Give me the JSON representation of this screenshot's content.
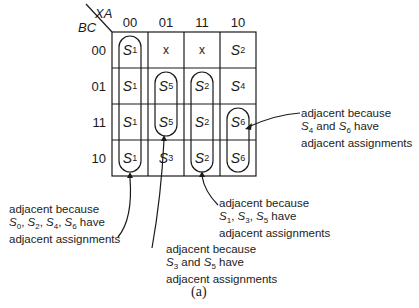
{
  "kmap": {
    "corner_col_var": "XA",
    "corner_row_var": "BC",
    "col_headers": [
      "00",
      "01",
      "11",
      "10"
    ],
    "row_headers": [
      "00",
      "01",
      "11",
      "10"
    ],
    "cells": [
      [
        {
          "s": "S",
          "n": "1"
        },
        {
          "t": "x"
        },
        {
          "t": "x"
        },
        {
          "s": "S",
          "n": "2"
        }
      ],
      [
        {
          "s": "S",
          "n": "1"
        },
        {
          "s": "S",
          "n": "5"
        },
        {
          "s": "S",
          "n": "2"
        },
        {
          "s": "S",
          "n": "4"
        }
      ],
      [
        {
          "s": "S",
          "n": "1"
        },
        {
          "s": "S",
          "n": "5"
        },
        {
          "s": "S",
          "n": "2"
        },
        {
          "s": "S",
          "n": "6"
        }
      ],
      [
        {
          "s": "S",
          "n": "1"
        },
        {
          "s": "S",
          "n": "3"
        },
        {
          "s": "S",
          "n": "2"
        },
        {
          "s": "S",
          "n": "6"
        }
      ]
    ],
    "groups": [
      {
        "name": "S1-column",
        "col": 0,
        "rows": [
          0,
          3
        ]
      },
      {
        "name": "S5-pair",
        "col": 1,
        "rows": [
          1,
          2
        ]
      },
      {
        "name": "S2-column",
        "col": 2,
        "rows": [
          1,
          3
        ]
      },
      {
        "name": "S6-pair",
        "col": 3,
        "rows": [
          2,
          3
        ]
      }
    ]
  },
  "annotations": {
    "s4_s6": {
      "line1": "adjacent because",
      "s_a": "S",
      "n_a": "4",
      "mid": " and ",
      "s_b": "S",
      "n_b": "6",
      "tail": " have",
      "line3": "adjacent assignments"
    },
    "s0246": {
      "line1": "adjacent because",
      "parts": [
        "S",
        "0",
        ", ",
        "S",
        "2",
        ", ",
        "S",
        "4",
        ", ",
        "S",
        "6"
      ],
      "tail": " have",
      "line3": "adjacent assignments"
    },
    "s135": {
      "line1": "adjacent because",
      "parts": [
        "S",
        "1",
        ", ",
        "S",
        "3",
        ", ",
        "S",
        "5"
      ],
      "tail": " have",
      "line3": "adjacent assignments"
    },
    "s35": {
      "line1": "adjacent because",
      "s_a": "S",
      "n_a": "3",
      "mid": " and ",
      "s_b": "S",
      "n_b": "5",
      "tail": " have",
      "line3": "adjacent assignments"
    }
  },
  "caption": "(a)"
}
